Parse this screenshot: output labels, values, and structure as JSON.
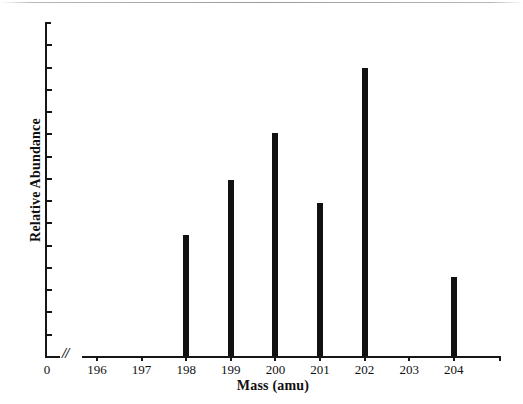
{
  "chart_data": {
    "type": "bar",
    "title": "",
    "xlabel": "Mass (amu)",
    "ylabel": "Relative Abundance",
    "categories": [
      "196",
      "197",
      "198",
      "199",
      "200",
      "201",
      "202",
      "203",
      "204"
    ],
    "values": [
      0,
      0,
      26,
      38,
      48,
      33,
      62,
      0,
      17
    ],
    "xlim": [
      196,
      204
    ],
    "ylim": [
      0,
      72
    ],
    "grid": false,
    "legend": null,
    "axis_break": {
      "symbol": "//",
      "between": [
        "0",
        "196"
      ]
    },
    "origin_tick_label": "0",
    "y_tick_count": 14,
    "y_tick_labels": [],
    "bar_color": "#111111",
    "axis_color": "#161616",
    "background_color": "#ffffff",
    "annotations": []
  },
  "axes": {
    "x_tick_labels": [
      "196",
      "197",
      "198",
      "199",
      "200",
      "201",
      "202",
      "203",
      "204"
    ],
    "x_title": "Mass (amu)",
    "y_title": "Relative Abundance",
    "origin": "0",
    "break_symbol": "//"
  }
}
